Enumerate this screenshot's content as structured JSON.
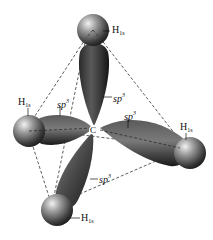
{
  "diagram": {
    "center_atom": {
      "label": "C"
    },
    "hydrogens": [
      {
        "id": "top",
        "label": "H",
        "subscript": "1s"
      },
      {
        "id": "left",
        "label": "H",
        "subscript": "1s"
      },
      {
        "id": "right",
        "label": "H",
        "subscript": "1s"
      },
      {
        "id": "bottom",
        "label": "H",
        "subscript": "1s"
      }
    ],
    "orbitals": [
      {
        "id": "top",
        "label": "sp",
        "superscript": "3"
      },
      {
        "id": "left",
        "label": "sp",
        "superscript": "3"
      },
      {
        "id": "right",
        "label": "sp",
        "superscript": "3"
      },
      {
        "id": "bottom",
        "label": "sp",
        "superscript": "3"
      }
    ],
    "colors": {
      "lobe_dark": "#1e1e1e",
      "lobe_light": "#9a9a9a",
      "background": "#ffffff",
      "dash": "#333333"
    }
  }
}
